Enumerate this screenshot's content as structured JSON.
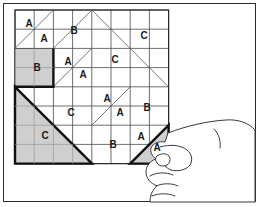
{
  "figure": {
    "frame": {
      "x": 3,
      "y": 3,
      "width": 253,
      "height": 199,
      "border_color": "#2b2b2b"
    },
    "background_color": "#ffffff"
  },
  "grid": {
    "origin_x": 15,
    "origin_y": 10,
    "cols": 8,
    "rows": 8,
    "cell": 19.2,
    "line_color": "#4a4a4a",
    "line_width": 0.8,
    "outer_line_color": "#2b2b2b",
    "outer_line_width": 1.2
  },
  "colors": {
    "shade_fill": "#cfcfcf",
    "shade_stroke": "#111111",
    "ink": "#1a1a1a",
    "thin_line": "#555555",
    "hand_line": "#3a3a3a"
  },
  "shaded_pieces": [
    {
      "name": "square-piece-b",
      "label": "B",
      "shape": "square",
      "points": "15,48.4 53.4,48.4 53.4,86.8 15,86.8",
      "heavy_edges": "15,86.8 53.4,86.8 53.4,48.4"
    },
    {
      "name": "triangle-piece-c",
      "label": "C",
      "shape": "right-triangle",
      "points": "15,86.8 92,163.6 15,163.6",
      "heavy_edges": "15,86.8 92,163.6 15,163.6 15,86.8"
    },
    {
      "name": "triangle-piece-a-detached",
      "label": "A",
      "shape": "right-triangle",
      "points": "130.2,163.6 168.6,125.2 168.6,163.6",
      "heavy_edges": "130.2,163.6 168.6,163.6 168.6,125.2"
    }
  ],
  "diagonals": [
    {
      "name": "diag-1",
      "x1": 15,
      "y1": 48.4,
      "x2": 53.4,
      "y2": 10
    },
    {
      "name": "diag-2",
      "x1": 34.2,
      "y1": 10,
      "x2": 34.2,
      "y2": 10
    },
    {
      "name": "diag-3",
      "x1": 15,
      "y1": 48.4,
      "x2": 34.2,
      "y2": 29.2
    },
    {
      "name": "diag-4",
      "x1": 53.4,
      "y1": 48.4,
      "x2": 91.8,
      "y2": 10
    },
    {
      "name": "diag-5",
      "x1": 91.8,
      "y1": 10,
      "x2": 149.4,
      "y2": 67.6
    },
    {
      "name": "diag-6",
      "x1": 149.4,
      "y1": 67.6,
      "x2": 168.6,
      "y2": 86.8
    },
    {
      "name": "diag-7",
      "x1": 53.4,
      "y1": 86.8,
      "x2": 91.8,
      "y2": 48.4
    },
    {
      "name": "diag-8",
      "x1": 91.8,
      "y1": 125.2,
      "x2": 130.2,
      "y2": 86.8
    },
    {
      "name": "diag-9",
      "x1": 130.2,
      "y1": 163.6,
      "x2": 168.6,
      "y2": 125.2
    }
  ],
  "labels": [
    {
      "name": "cell-label-a-1",
      "text": "A",
      "x": 29,
      "y": 24
    },
    {
      "name": "cell-label-a-2",
      "text": "A",
      "x": 44,
      "y": 39
    },
    {
      "name": "cell-label-b-1",
      "text": "B",
      "x": 74,
      "y": 31
    },
    {
      "name": "cell-label-c-1",
      "text": "C",
      "x": 144,
      "y": 36
    },
    {
      "name": "cell-label-b-2",
      "text": "B",
      "x": 37,
      "y": 68
    },
    {
      "name": "cell-label-a-3",
      "text": "A",
      "x": 68,
      "y": 62
    },
    {
      "name": "cell-label-a-4",
      "text": "A",
      "x": 83,
      "y": 75
    },
    {
      "name": "cell-label-c-2",
      "text": "C",
      "x": 115,
      "y": 60
    },
    {
      "name": "cell-label-c-3",
      "text": "C",
      "x": 71,
      "y": 113
    },
    {
      "name": "cell-label-a-5",
      "text": "A",
      "x": 107,
      "y": 99
    },
    {
      "name": "cell-label-a-6",
      "text": "A",
      "x": 120,
      "y": 113
    },
    {
      "name": "cell-label-b-3",
      "text": "B",
      "x": 147,
      "y": 108
    },
    {
      "name": "cell-label-c-4",
      "text": "C",
      "x": 45,
      "y": 136
    },
    {
      "name": "cell-label-b-4",
      "text": "B",
      "x": 113,
      "y": 145
    },
    {
      "name": "cell-label-a-7",
      "text": "A",
      "x": 141,
      "y": 137
    },
    {
      "name": "cell-label-a-8",
      "text": "A",
      "x": 157,
      "y": 148
    }
  ],
  "hand": {
    "name": "hand-placing-piece",
    "description": "line-drawn hand with thumb and index finger holding the small triangle piece",
    "outline": "M168,133 C186,126 208,121 226,120 C238,119 249,123 255,130 L255,202 L150,202 C150,196 152,190 157,186 C150,183 146,178 146,172 C146,166 150,161 156,159 C152,156 150,152 151,148 C153,143 159,141 165,142 L168,133 Z",
    "knuckle": "M214,129 C219,134 221,141 220,148",
    "thumb": "M160,147 C170,144 181,145 187,150 C192,154 193,160 190,165 C186,170 178,172 171,170",
    "thumb_tip": "M171,170 C166,168 162,164 161,159",
    "finger_1": "M156,186 C163,183 172,183 178,186",
    "finger_2": "M150,176 C157,172 166,172 173,175",
    "finger_3": "M152,196 C159,193 168,193 175,196",
    "nail": "M157,156 C161,153 166,153 169,156 C171,159 170,163 167,165 C163,167 159,166 157,163 C155,160 155,158 157,156 Z"
  }
}
